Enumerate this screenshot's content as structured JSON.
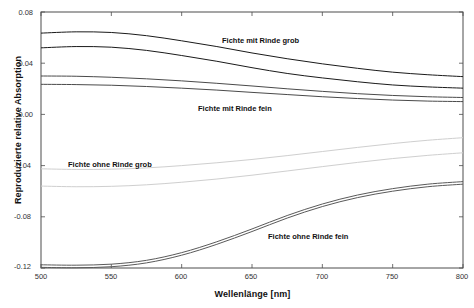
{
  "chart_data": {
    "type": "line",
    "title": "",
    "xlabel": "Wellenlänge [nm]",
    "ylabel": "Reproduzierte relative Absorption",
    "xlim": [
      500,
      800
    ],
    "ylim": [
      -0.12,
      0.08
    ],
    "xticks": [
      "500",
      "550",
      "600",
      "650",
      "700",
      "750",
      "800"
    ],
    "yticks": [
      "0.08",
      "0.04",
      "0.00",
      "-0.04",
      "-0.08",
      "-0.12"
    ],
    "grid": false,
    "legend_position": "inline-annotations",
    "x": [
      500,
      525,
      550,
      575,
      600,
      625,
      650,
      675,
      700,
      725,
      750,
      775,
      800
    ],
    "series": [
      {
        "name": "Fichte mit Rinde grob",
        "annotation": "Fichte mit Rinde grob",
        "color": "#1a1a1a",
        "values": [
          0.0635,
          0.0645,
          0.064,
          0.0615,
          0.0575,
          0.053,
          0.048,
          0.0435,
          0.0395,
          0.036,
          0.033,
          0.031,
          0.0295
        ]
      },
      {
        "name": "Fichte mit Rinde grob (2)",
        "annotation": "",
        "color": "#1a1a1a",
        "values": [
          0.052,
          0.053,
          0.0525,
          0.05,
          0.046,
          0.0415,
          0.0365,
          0.032,
          0.0285,
          0.0255,
          0.023,
          0.0215,
          0.0205
        ]
      },
      {
        "name": "Fichte mit Rinde fein",
        "annotation": "Fichte mit Rinde fein",
        "color": "#4a4a4a",
        "values": [
          0.03,
          0.0298,
          0.029,
          0.0278,
          0.0262,
          0.0243,
          0.0222,
          0.02,
          0.018,
          0.0162,
          0.0148,
          0.0138,
          0.0132
        ]
      },
      {
        "name": "Fichte mit Rinde fein (2)",
        "annotation": "",
        "color": "#4a4a4a",
        "values": [
          0.0235,
          0.0233,
          0.0228,
          0.0218,
          0.0205,
          0.019,
          0.0172,
          0.0155,
          0.0138,
          0.0124,
          0.0112,
          0.0104,
          0.01
        ]
      },
      {
        "name": "Fichte ohne Rinde grob",
        "annotation": "Fichte ohne Rinde grob",
        "color": "#cfcfcf",
        "values": [
          -0.0425,
          -0.043,
          -0.0428,
          -0.0418,
          -0.04,
          -0.0378,
          -0.0352,
          -0.0322,
          -0.029,
          -0.0258,
          -0.0228,
          -0.0202,
          -0.0182
        ]
      },
      {
        "name": "Fichte ohne Rinde grob (2)",
        "annotation": "",
        "color": "#cfcfcf",
        "values": [
          -0.056,
          -0.0565,
          -0.0562,
          -0.055,
          -0.053,
          -0.0505,
          -0.0475,
          -0.0442,
          -0.0408,
          -0.0375,
          -0.0345,
          -0.032,
          -0.03
        ]
      },
      {
        "name": "Fichte ohne Rinde fein",
        "annotation": "Fichte ohne Rinde fein",
        "color": "#5a5a5a",
        "values": [
          -0.1175,
          -0.1178,
          -0.117,
          -0.114,
          -0.108,
          -0.0995,
          -0.0895,
          -0.079,
          -0.07,
          -0.063,
          -0.058,
          -0.0545,
          -0.0525
        ]
      },
      {
        "name": "Fichte ohne Rinde fein (2)",
        "annotation": "",
        "color": "#5a5a5a",
        "values": [
          -0.1195,
          -0.1198,
          -0.119,
          -0.116,
          -0.11,
          -0.1015,
          -0.0915,
          -0.081,
          -0.072,
          -0.065,
          -0.06,
          -0.0565,
          -0.0545
        ]
      }
    ]
  },
  "annotations": [
    {
      "label": "Fichte mit Rinde grob",
      "left": 222,
      "top": 36
    },
    {
      "label": "Fichte mit Rinde fein",
      "left": 198,
      "top": 104
    },
    {
      "label": "Fichte ohne Rinde grob",
      "left": 68,
      "top": 160
    },
    {
      "label": "Fichte ohne Rinde fein",
      "left": 268,
      "top": 232
    }
  ],
  "axes": {
    "x_title": "Wellenlänge [nm]",
    "y_title": "Reproduzierte relative Absorption"
  }
}
